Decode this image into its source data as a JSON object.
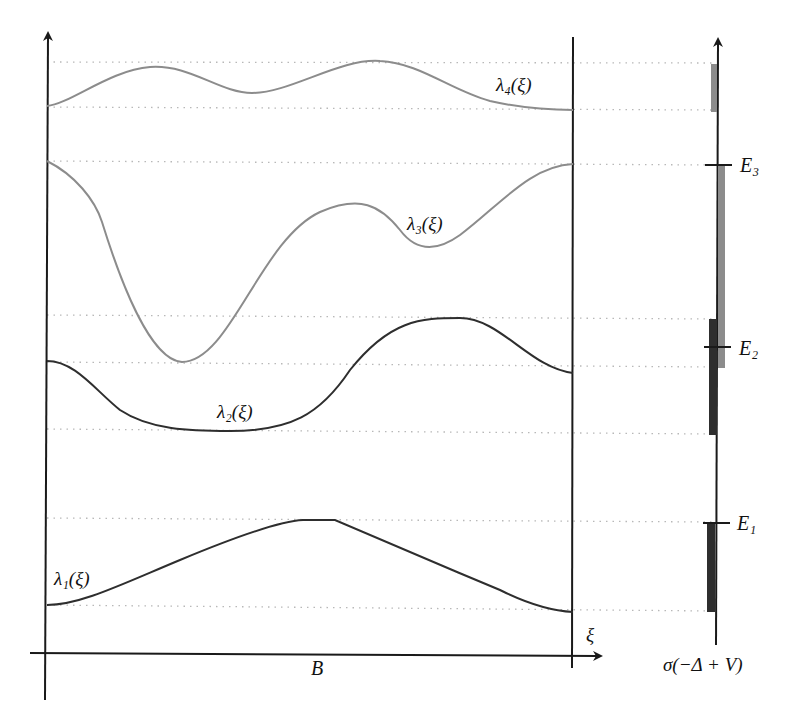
{
  "figure": {
    "labels": {
      "lambda1": "λ₁(ξ)",
      "lambda2": "λ₂(ξ)",
      "lambda3": "λ₃(ξ)",
      "lambda4": "λ₄(ξ)",
      "x_axis": "ξ",
      "domain": "B",
      "spectrum_axis": "σ(−Δ + V)",
      "E1": "E₁",
      "E2": "E₂",
      "E3": "E₃"
    },
    "colors": {
      "light_band": "#8c8c8c",
      "dark_band": "#2e2e2e",
      "axis": "#1a1a1a",
      "dotted": "#b8b8b8"
    },
    "curves": [
      {
        "name": "λ1(ξ)",
        "shade": "dark",
        "band_range": [
          518,
          610
        ]
      },
      {
        "name": "λ2(ξ)",
        "shade": "dark",
        "band_range": [
          316,
          430
        ]
      },
      {
        "name": "λ3(ξ)",
        "shade": "light",
        "band_range": [
          162,
          364
        ]
      },
      {
        "name": "λ4(ξ)",
        "shade": "light",
        "band_range": [
          62,
          108
        ]
      }
    ],
    "thresholds": [
      {
        "name": "E1",
        "level": "top of λ1 band"
      },
      {
        "name": "E2",
        "level": "inside overlap of λ2 and λ3 bands"
      },
      {
        "name": "E3",
        "level": "top of λ3 band"
      }
    ]
  }
}
